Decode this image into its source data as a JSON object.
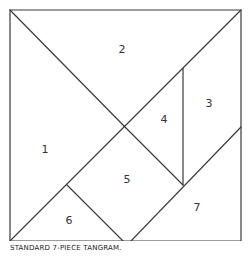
{
  "diagram": {
    "title": "Standard 7-piece tangram",
    "pieces": [
      {
        "id": 1,
        "label": "1",
        "label_pos": [
          45,
          150
        ]
      },
      {
        "id": 2,
        "label": "2",
        "label_pos": [
          122,
          50
        ]
      },
      {
        "id": 3,
        "label": "3",
        "label_pos": [
          209,
          104
        ]
      },
      {
        "id": 4,
        "label": "4",
        "label_pos": [
          164,
          120
        ]
      },
      {
        "id": 5,
        "label": "5",
        "label_pos": [
          127,
          180
        ]
      },
      {
        "id": 6,
        "label": "6",
        "label_pos": [
          69,
          221
        ]
      },
      {
        "id": 7,
        "label": "7",
        "label_pos": [
          197,
          208
        ]
      }
    ]
  },
  "caption": "STANDARD 7-PIECE TANGRAM."
}
